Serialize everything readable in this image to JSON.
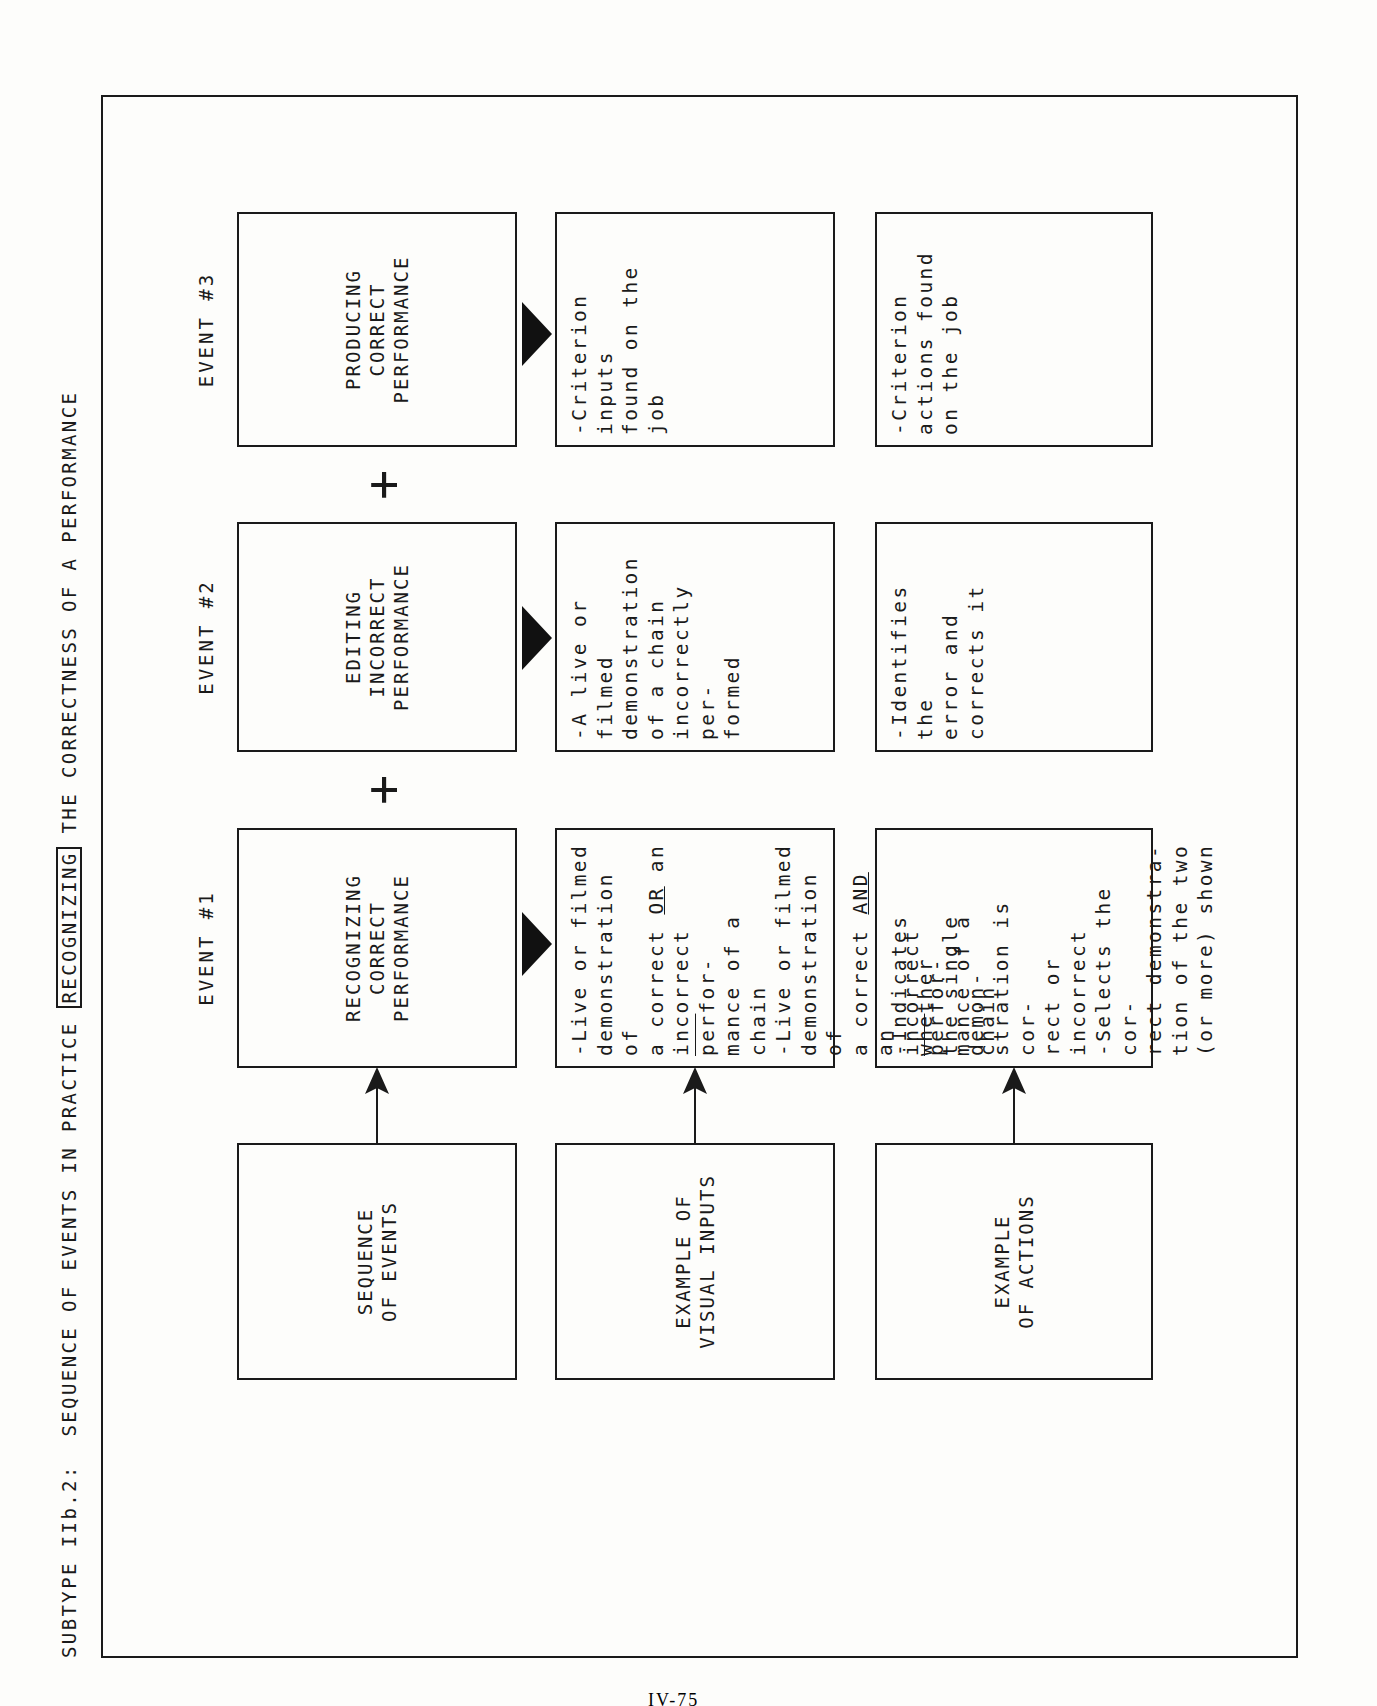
{
  "title": {
    "prefix": "SUBTYPE IIb.2:",
    "before": "SEQUENCE OF EVENTS IN PRACTICE",
    "boxed": "RECOGNIZING",
    "after": "THE CORRECTNESS OF A PERFORMANCE"
  },
  "rows": {
    "sequence": "SEQUENCE\nOF EVENTS",
    "visual": "EXAMPLE OF\nVISUAL INPUTS",
    "actions": "EXAMPLE\nOF ACTIONS"
  },
  "events": [
    {
      "label": "EVENT #1",
      "name": "RECOGNIZING\nCORRECT\nPERFORMANCE",
      "visual_a_1": "-Live or filmed\n demonstration of\n a correct ",
      "visual_a_or": "OR",
      "visual_a_2": " an\n incorrect ",
      "visual_a_per": "per",
      "visual_a_3": "for-\n mance of a chain",
      "visual_b_1": "-Live or filmed\n demonstration of\n a correct ",
      "visual_b_and": "AND",
      "visual_b_2": " an\n incorrect ",
      "visual_b_per": "per",
      "visual_b_3": "for-\n mance of a chain",
      "action_a": "-Indicates whether\n the single demon-\n stration is cor-\n rect or incorrect",
      "action_b": "-Selects the cor-\n rect demonstra-\n tion of the two\n (or more) shown"
    },
    {
      "label": "EVENT #2",
      "name": "EDITING\nINCORRECT\nPERFORMANCE",
      "visual": "-A live or filmed\n demonstration\n of a chain\n incorrectly per-\n formed",
      "action": "-Identifies the\n error and\n corrects it"
    },
    {
      "label": "EVENT #3",
      "name": "PRODUCING\nCORRECT\nPERFORMANCE",
      "visual": "-Criterion inputs\n found on the job",
      "action": "-Criterion\n actions found\n on the job"
    }
  ],
  "connectors": {
    "plus": "+"
  },
  "footer": {
    "page_number": "IV-75"
  }
}
